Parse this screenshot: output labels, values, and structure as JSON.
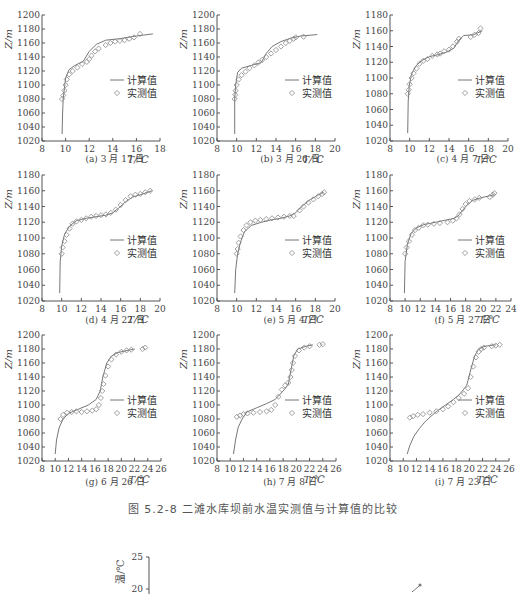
{
  "figure_title": "图 5.2-8   二滩水库坝前水温实测值与计算值的比较",
  "legend": {
    "computed": "计算值",
    "measured": "实测值"
  },
  "axis": {
    "ylabel": "Z/m",
    "xlabel": "T/℃"
  },
  "colors": {
    "line": "#777777",
    "marker": "#888888",
    "axis": "#555555",
    "text": "#444444"
  },
  "chart_data": [
    {
      "id": "a",
      "type": "line",
      "title": "(a) 3 月 17 日",
      "xlabel": "T/℃",
      "ylabel": "Z/m",
      "xlim": [
        8,
        18
      ],
      "ylim": [
        1020,
        1200
      ],
      "xticks": [
        8,
        10,
        12,
        14,
        16,
        18
      ],
      "yticks": [
        1020,
        1040,
        1060,
        1080,
        1100,
        1120,
        1140,
        1160,
        1180,
        1200
      ],
      "legend": [
        "计算值",
        "实测值"
      ],
      "series": [
        {
          "name": "计算值",
          "kind": "line",
          "x": [
            9.7,
            9.75,
            9.8,
            9.9,
            10.0,
            10.3,
            10.8,
            11.5,
            12.0,
            12.6,
            13.4,
            14.5,
            16.0,
            17.4
          ],
          "y": [
            1030,
            1060,
            1080,
            1095,
            1110,
            1122,
            1128,
            1134,
            1148,
            1158,
            1164,
            1166,
            1170,
            1173
          ]
        },
        {
          "name": "实测值",
          "kind": "scatter",
          "x": [
            9.7,
            9.8,
            9.9,
            10.0,
            10.1,
            10.3,
            10.6,
            11.0,
            11.4,
            11.8,
            12.0,
            12.2,
            12.5,
            12.8,
            13.4,
            13.8,
            14.2,
            14.6,
            15.0,
            15.4,
            15.8,
            16.3
          ],
          "y": [
            1080,
            1085,
            1092,
            1100,
            1108,
            1115,
            1120,
            1125,
            1130,
            1133,
            1137,
            1142,
            1148,
            1152,
            1157,
            1160,
            1162,
            1163,
            1164,
            1166,
            1168,
            1173
          ]
        }
      ]
    },
    {
      "id": "b",
      "type": "line",
      "title": "(b) 3 月 26 日",
      "xlabel": "T/℃",
      "ylabel": "Z/m",
      "xlim": [
        8,
        20
      ],
      "ylim": [
        1020,
        1200
      ],
      "xticks": [
        8,
        10,
        12,
        14,
        16,
        18,
        20
      ],
      "yticks": [
        1020,
        1040,
        1060,
        1080,
        1100,
        1120,
        1140,
        1160,
        1180,
        1200
      ],
      "legend": [
        "计算值",
        "实测值"
      ],
      "series": [
        {
          "name": "计算值",
          "kind": "line",
          "x": [
            9.8,
            9.8,
            9.9,
            10.1,
            10.5,
            11.5,
            12.5,
            13.0,
            13.6,
            14.5,
            15.5,
            16.5,
            18.2
          ],
          "y": [
            1030,
            1080,
            1100,
            1118,
            1124,
            1128,
            1132,
            1145,
            1155,
            1162,
            1167,
            1170,
            1172
          ]
        },
        {
          "name": "实测值",
          "kind": "scatter",
          "x": [
            9.8,
            9.85,
            9.9,
            10.0,
            10.2,
            10.5,
            10.9,
            11.3,
            11.8,
            12.2,
            12.6,
            13.0,
            13.5,
            14.0,
            14.5,
            15.0,
            15.4,
            15.8,
            16.0,
            16.8
          ],
          "y": [
            1080,
            1086,
            1092,
            1100,
            1108,
            1114,
            1119,
            1124,
            1128,
            1132,
            1136,
            1140,
            1145,
            1150,
            1155,
            1160,
            1163,
            1166,
            1168,
            1169
          ]
        }
      ]
    },
    {
      "id": "c",
      "type": "line",
      "title": "(c) 4 月 7 日",
      "xlabel": "T/℃",
      "ylabel": "Z/m",
      "xlim": [
        8,
        20
      ],
      "ylim": [
        1020,
        1180
      ],
      "xticks": [
        8,
        10,
        12,
        14,
        16,
        18,
        20
      ],
      "yticks": [
        1020,
        1040,
        1060,
        1080,
        1100,
        1120,
        1140,
        1160,
        1180
      ],
      "legend": [
        "计算值",
        "实测值"
      ],
      "series": [
        {
          "name": "计算值",
          "kind": "line",
          "x": [
            9.8,
            9.85,
            9.95,
            10.2,
            10.6,
            11.2,
            12.0,
            13.0,
            13.8,
            14.5,
            15.0,
            15.5,
            16.5,
            17.4
          ],
          "y": [
            1030,
            1070,
            1090,
            1105,
            1115,
            1122,
            1127,
            1130,
            1133,
            1138,
            1148,
            1154,
            1155,
            1160
          ]
        },
        {
          "name": "实测值",
          "kind": "scatter",
          "x": [
            9.8,
            9.9,
            10.0,
            10.2,
            10.4,
            10.7,
            11.0,
            11.4,
            11.8,
            12.3,
            12.8,
            13.1,
            13.5,
            14.0,
            14.4,
            14.8,
            15.0,
            16.2,
            16.6,
            17.0,
            17.2
          ],
          "y": [
            1080,
            1085,
            1092,
            1100,
            1106,
            1112,
            1118,
            1122,
            1124,
            1128,
            1130,
            1131,
            1134,
            1136,
            1140,
            1146,
            1150,
            1152,
            1155,
            1157,
            1163
          ]
        }
      ]
    },
    {
      "id": "d",
      "type": "line",
      "title": "(d) 4 月 22 日",
      "xlabel": "T/℃",
      "ylabel": "Z/m",
      "xlim": [
        8,
        20
      ],
      "ylim": [
        1020,
        1180
      ],
      "xticks": [
        8,
        10,
        12,
        14,
        16,
        18,
        20
      ],
      "yticks": [
        1020,
        1040,
        1060,
        1080,
        1100,
        1120,
        1140,
        1160,
        1180
      ],
      "legend": [
        "计算值",
        "实测值"
      ],
      "series": [
        {
          "name": "计算值",
          "kind": "line",
          "x": [
            9.8,
            9.85,
            10.0,
            10.3,
            10.8,
            11.5,
            12.5,
            13.5,
            14.5,
            15.2,
            15.8,
            16.5,
            17.2,
            18.0,
            19.2
          ],
          "y": [
            1030,
            1070,
            1090,
            1105,
            1115,
            1122,
            1125,
            1127,
            1129,
            1132,
            1138,
            1146,
            1152,
            1155,
            1160
          ]
        },
        {
          "name": "实测值",
          "kind": "scatter",
          "x": [
            10.0,
            10.1,
            10.3,
            10.5,
            10.8,
            11.1,
            11.5,
            12.0,
            12.5,
            13.0,
            13.5,
            14.0,
            14.5,
            15.0,
            15.5,
            16.0,
            16.5,
            17.0,
            17.5,
            18.0,
            18.5,
            19.0
          ],
          "y": [
            1080,
            1088,
            1096,
            1104,
            1112,
            1118,
            1121,
            1123,
            1125,
            1127,
            1128,
            1129,
            1130,
            1132,
            1136,
            1142,
            1148,
            1153,
            1155,
            1156,
            1158,
            1160
          ]
        }
      ]
    },
    {
      "id": "e",
      "type": "line",
      "title": "(e) 5 月 4 日",
      "xlabel": "T/℃",
      "ylabel": "Z/m",
      "xlim": [
        8,
        20
      ],
      "ylim": [
        1020,
        1180
      ],
      "xticks": [
        8,
        10,
        12,
        14,
        16,
        18,
        20
      ],
      "yticks": [
        1020,
        1040,
        1060,
        1080,
        1100,
        1120,
        1140,
        1160,
        1180
      ],
      "legend": [
        "计算值",
        "实测值"
      ],
      "series": [
        {
          "name": "计算值",
          "kind": "line",
          "x": [
            9.8,
            9.9,
            10.1,
            10.4,
            10.8,
            11.5,
            12.5,
            13.5,
            14.5,
            15.4,
            16.0,
            16.6,
            17.4,
            18.2,
            18.8
          ],
          "y": [
            1030,
            1060,
            1080,
            1095,
            1108,
            1116,
            1120,
            1123,
            1125,
            1128,
            1132,
            1140,
            1148,
            1154,
            1158
          ]
        },
        {
          "name": "实测值",
          "kind": "scatter",
          "x": [
            10.0,
            10.1,
            10.2,
            10.4,
            10.7,
            11.0,
            11.4,
            11.9,
            12.4,
            13.0,
            13.6,
            14.2,
            14.8,
            15.4,
            15.8,
            16.4,
            16.8,
            17.3,
            17.8,
            18.3,
            18.7,
            18.9
          ],
          "y": [
            1080,
            1086,
            1094,
            1102,
            1110,
            1116,
            1120,
            1122,
            1123,
            1124,
            1125,
            1126,
            1127,
            1128,
            1128,
            1135,
            1140,
            1145,
            1149,
            1153,
            1156,
            1158
          ]
        }
      ]
    },
    {
      "id": "f",
      "type": "line",
      "title": "(f) 5 月 27 日",
      "xlabel": "T/℃",
      "ylabel": "Z/m",
      "xlim": [
        8,
        24
      ],
      "ylim": [
        1020,
        1180
      ],
      "xticks": [
        8,
        10,
        12,
        14,
        16,
        18,
        20,
        22,
        24
      ],
      "yticks": [
        1020,
        1040,
        1060,
        1080,
        1100,
        1120,
        1140,
        1160,
        1180
      ],
      "legend": [
        "计算值",
        "实测值"
      ],
      "series": [
        {
          "name": "计算值",
          "kind": "line",
          "x": [
            9.9,
            10.0,
            10.3,
            10.8,
            11.5,
            12.5,
            14.0,
            15.5,
            16.5,
            17.0,
            17.6,
            18.2,
            19.0,
            20.0,
            21.8
          ],
          "y": [
            1030,
            1070,
            1092,
            1106,
            1113,
            1117,
            1120,
            1123,
            1125,
            1128,
            1135,
            1142,
            1148,
            1151,
            1155
          ]
        },
        {
          "name": "实测值",
          "kind": "scatter",
          "x": [
            10.0,
            10.2,
            10.5,
            10.9,
            11.3,
            11.8,
            12.4,
            13.0,
            13.8,
            14.6,
            15.6,
            16.3,
            16.8,
            17.2,
            17.6,
            18.0,
            18.5,
            19.2,
            19.8,
            21.2,
            21.6,
            21.8
          ],
          "y": [
            1080,
            1088,
            1096,
            1104,
            1110,
            1113,
            1116,
            1117,
            1118,
            1119,
            1120,
            1122,
            1125,
            1130,
            1137,
            1143,
            1147,
            1149,
            1151,
            1152,
            1155,
            1157
          ]
        }
      ]
    },
    {
      "id": "g",
      "type": "line",
      "title": "(g) 6 月 26 日",
      "xlabel": "T/℃",
      "ylabel": "Z/m",
      "xlim": [
        8,
        26
      ],
      "ylim": [
        1020,
        1200
      ],
      "xticks": [
        8,
        10,
        12,
        14,
        16,
        18,
        20,
        22,
        24,
        26
      ],
      "yticks": [
        1020,
        1040,
        1060,
        1080,
        1100,
        1120,
        1140,
        1160,
        1180,
        1200
      ],
      "legend": [
        "计算值",
        "实测值"
      ],
      "series": [
        {
          "name": "计算值",
          "kind": "line",
          "x": [
            10.0,
            10.2,
            10.6,
            11.2,
            12.0,
            13.5,
            15.0,
            16.2,
            16.8,
            17.2,
            17.8,
            18.5,
            19.5,
            21.0,
            22.0
          ],
          "y": [
            1030,
            1050,
            1068,
            1080,
            1088,
            1094,
            1100,
            1108,
            1120,
            1140,
            1160,
            1170,
            1175,
            1178,
            1180
          ]
        },
        {
          "name": "实测值",
          "kind": "scatter",
          "x": [
            10.8,
            11.2,
            11.8,
            12.5,
            13.2,
            14.0,
            14.8,
            15.6,
            16.2,
            16.6,
            16.9,
            17.1,
            17.3,
            17.6,
            18.0,
            18.5,
            19.2,
            20.0,
            20.8,
            21.5,
            23.2,
            23.6
          ],
          "y": [
            1080,
            1086,
            1089,
            1090,
            1091,
            1090,
            1091,
            1092,
            1094,
            1100,
            1110,
            1120,
            1130,
            1142,
            1155,
            1165,
            1172,
            1176,
            1178,
            1179,
            1180,
            1182
          ]
        }
      ]
    },
    {
      "id": "h",
      "type": "line",
      "title": "(h) 7 月 8 日",
      "xlabel": "T/℃",
      "ylabel": "Z/m",
      "xlim": [
        8,
        26
      ],
      "ylim": [
        1020,
        1200
      ],
      "xticks": [
        8,
        10,
        12,
        14,
        16,
        18,
        20,
        22,
        24,
        26
      ],
      "yticks": [
        1020,
        1040,
        1060,
        1080,
        1100,
        1120,
        1140,
        1160,
        1180,
        1200
      ],
      "legend": [
        "计算值",
        "实测值"
      ],
      "series": [
        {
          "name": "计算值",
          "kind": "line",
          "x": [
            10.5,
            10.8,
            11.2,
            11.8,
            12.5,
            14.0,
            15.5,
            16.8,
            17.5,
            18.2,
            18.8,
            19.2,
            19.6,
            20.2,
            21.5,
            22.5
          ],
          "y": [
            1030,
            1050,
            1068,
            1080,
            1090,
            1096,
            1102,
            1108,
            1115,
            1122,
            1130,
            1150,
            1170,
            1180,
            1184,
            1186
          ]
        },
        {
          "name": "实测值",
          "kind": "scatter",
          "x": [
            11.0,
            11.5,
            12.0,
            12.6,
            13.5,
            14.5,
            15.5,
            16.2,
            16.8,
            17.3,
            17.8,
            18.3,
            18.8,
            19.1,
            19.3,
            19.5,
            19.8,
            20.4,
            21.2,
            22.0,
            23.5,
            24.0
          ],
          "y": [
            1083,
            1085,
            1087,
            1088,
            1089,
            1090,
            1091,
            1093,
            1100,
            1112,
            1122,
            1128,
            1132,
            1140,
            1150,
            1160,
            1170,
            1178,
            1182,
            1184,
            1186,
            1187
          ]
        }
      ]
    },
    {
      "id": "i",
      "type": "line",
      "title": "(i) 7 月 23 日",
      "xlabel": "T/℃",
      "ylabel": "Z/m",
      "xlim": [
        8,
        26
      ],
      "ylim": [
        1020,
        1200
      ],
      "xticks": [
        8,
        10,
        12,
        14,
        16,
        18,
        20,
        22,
        24,
        26
      ],
      "yticks": [
        1020,
        1040,
        1060,
        1080,
        1100,
        1120,
        1140,
        1160,
        1180,
        1200
      ],
      "legend": [
        "计算值",
        "实测值"
      ],
      "series": [
        {
          "name": "计算值",
          "kind": "line",
          "x": [
            10.6,
            11.0,
            11.6,
            12.4,
            13.3,
            14.2,
            15.2,
            16.4,
            17.6,
            18.6,
            19.6,
            20.2,
            20.8,
            21.4,
            22.4,
            24.0
          ],
          "y": [
            1030,
            1042,
            1055,
            1066,
            1076,
            1084,
            1092,
            1100,
            1108,
            1116,
            1128,
            1150,
            1170,
            1180,
            1184,
            1186
          ]
        },
        {
          "name": "实测值",
          "kind": "scatter",
          "x": [
            11.0,
            11.5,
            12.2,
            13.0,
            14.0,
            15.0,
            16.0,
            16.8,
            17.6,
            18.4,
            19.2,
            19.8,
            20.2,
            20.6,
            21.0,
            21.4,
            21.8,
            22.2,
            23.4,
            24.0,
            24.6
          ],
          "y": [
            1082,
            1084,
            1086,
            1087,
            1089,
            1091,
            1094,
            1098,
            1104,
            1110,
            1116,
            1124,
            1140,
            1155,
            1168,
            1176,
            1180,
            1182,
            1184,
            1185,
            1186
          ]
        }
      ]
    }
  ],
  "bottom_partial_chart": {
    "ylabel": "温/℃",
    "yticks_visible": [
      "25",
      "20"
    ]
  }
}
